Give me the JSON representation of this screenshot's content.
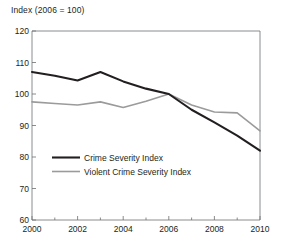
{
  "chart_data": {
    "type": "line",
    "title": "Index (2006 = 100)",
    "xlabel": "",
    "ylabel": "Index (2006 = 100)",
    "x": [
      2000,
      2001,
      2002,
      2003,
      2004,
      2005,
      2006,
      2007,
      2008,
      2009,
      2010
    ],
    "xlim": [
      2000,
      2010
    ],
    "ylim": [
      60,
      120
    ],
    "xticks": [
      2000,
      2001,
      2002,
      2003,
      2004,
      2005,
      2006,
      2007,
      2008,
      2009,
      2010
    ],
    "xtick_labels": [
      "2000",
      "",
      "2002",
      "",
      "2004",
      "",
      "2006",
      "",
      "2008",
      "",
      "2010"
    ],
    "yticks": [
      60,
      70,
      80,
      90,
      100,
      110,
      120
    ],
    "ytick_labels": [
      "60",
      "70",
      "80",
      "90",
      "100",
      "110",
      "120"
    ],
    "grid": false,
    "legend_position": "center-left",
    "series": [
      {
        "name": "Crime Severity Index",
        "color": "#231f20",
        "values": [
          107.0,
          105.8,
          104.3,
          107.0,
          104.0,
          101.7,
          100.0,
          95.0,
          91.0,
          86.8,
          82.0
        ]
      },
      {
        "name": "Violent Crime Severity Index",
        "color": "#9b9b9b",
        "values": [
          97.5,
          97.0,
          96.5,
          97.5,
          95.7,
          97.7,
          100.0,
          96.5,
          94.3,
          94.0,
          88.3
        ]
      }
    ]
  },
  "axis_title": {
    "text": "Index (2006 = 100)"
  },
  "y_axis": {
    "labels": [
      "120",
      "110",
      "100",
      "90",
      "80",
      "70",
      "60"
    ]
  },
  "x_axis": {
    "labels": [
      "2000",
      "2002",
      "2004",
      "2006",
      "2008",
      "2010"
    ]
  },
  "legend": {
    "items": [
      {
        "label": "Crime Severity Index",
        "color": "#231f20"
      },
      {
        "label": "Violent Crime Severity Index",
        "color": "#9b9b9b"
      }
    ]
  },
  "colors": {
    "axis": "#6d6e71",
    "primary_series": "#231f20",
    "secondary_series": "#9b9b9b",
    "text": "#231f20",
    "background": "#ffffff"
  }
}
